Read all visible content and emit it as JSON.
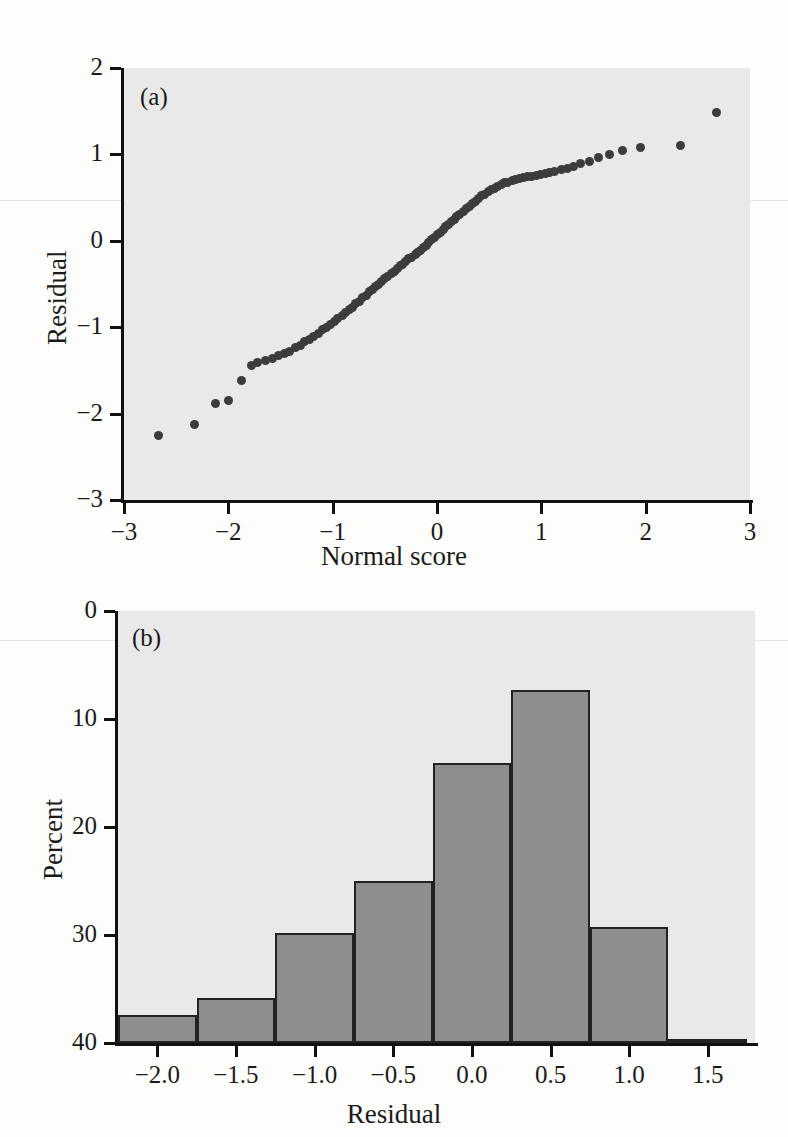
{
  "figure": {
    "background_color": "#fdfdfc",
    "plot_background_color": "#e9e9e9",
    "axis_color": "#111111",
    "point_color": "#3c3c3c",
    "bar_fill_color": "#8e8e8e",
    "bar_edge_color": "#222222"
  },
  "panel_a": {
    "tag": "(a)",
    "xlabel": "Normal score",
    "ylabel": "Residual",
    "xticks": [
      "−3",
      "−2",
      "−1",
      "0",
      "1",
      "2",
      "3"
    ],
    "yticks": [
      "2",
      "1",
      "0",
      "−1",
      "−2",
      "−3"
    ]
  },
  "panel_b": {
    "tag": "(b)",
    "xlabel": "Residual",
    "ylabel": "Percent",
    "xticks": [
      "−2.0",
      "−1.5",
      "−1.0",
      "−0.5",
      "0.0",
      "0.5",
      "1.0",
      "1.5"
    ],
    "yticks": [
      "40",
      "30",
      "20",
      "10",
      "0"
    ]
  },
  "chart_data": [
    {
      "type": "scatter",
      "title": "(a)",
      "xlabel": "Normal score",
      "ylabel": "Residual",
      "xlim": [
        -3,
        3
      ],
      "ylim": [
        -3,
        2
      ],
      "xticks": [
        -3,
        -2,
        -1,
        0,
        1,
        2,
        3
      ],
      "yticks": [
        2,
        1,
        0,
        -1,
        -2,
        -3
      ],
      "grid": false,
      "legend": "none",
      "series": [
        {
          "name": "Normal probability plot of residuals",
          "points": [
            [
              -2.67,
              -2.25
            ],
            [
              -2.32,
              -2.13
            ],
            [
              -2.12,
              -1.88
            ],
            [
              -2.0,
              -1.85
            ],
            [
              -1.87,
              -1.62
            ],
            [
              -1.78,
              -1.44
            ],
            [
              -1.72,
              -1.41
            ],
            [
              -1.64,
              -1.38
            ],
            [
              -1.58,
              -1.36
            ],
            [
              -1.52,
              -1.33
            ],
            [
              -1.46,
              -1.3
            ],
            [
              -1.41,
              -1.28
            ],
            [
              -1.36,
              -1.24
            ],
            [
              -1.31,
              -1.21
            ],
            [
              -1.27,
              -1.17
            ],
            [
              -1.22,
              -1.14
            ],
            [
              -1.18,
              -1.11
            ],
            [
              -1.14,
              -1.07
            ],
            [
              -1.1,
              -1.03
            ],
            [
              -1.06,
              -1.0
            ],
            [
              -1.02,
              -0.97
            ],
            [
              -0.98,
              -0.93
            ],
            [
              -0.95,
              -0.9
            ],
            [
              -0.91,
              -0.87
            ],
            [
              -0.88,
              -0.83
            ],
            [
              -0.84,
              -0.8
            ],
            [
              -0.81,
              -0.77
            ],
            [
              -0.78,
              -0.73
            ],
            [
              -0.74,
              -0.7
            ],
            [
              -0.71,
              -0.66
            ],
            [
              -0.68,
              -0.63
            ],
            [
              -0.65,
              -0.59
            ],
            [
              -0.62,
              -0.56
            ],
            [
              -0.59,
              -0.53
            ],
            [
              -0.56,
              -0.5
            ],
            [
              -0.53,
              -0.47
            ],
            [
              -0.5,
              -0.44
            ],
            [
              -0.47,
              -0.41
            ],
            [
              -0.44,
              -0.38
            ],
            [
              -0.41,
              -0.35
            ],
            [
              -0.38,
              -0.32
            ],
            [
              -0.35,
              -0.29
            ],
            [
              -0.33,
              -0.27
            ],
            [
              -0.3,
              -0.24
            ],
            [
              -0.27,
              -0.21
            ],
            [
              -0.24,
              -0.19
            ],
            [
              -0.21,
              -0.16
            ],
            [
              -0.19,
              -0.13
            ],
            [
              -0.16,
              -0.11
            ],
            [
              -0.13,
              -0.08
            ],
            [
              -0.1,
              -0.05
            ],
            [
              -0.08,
              -0.02
            ],
            [
              -0.05,
              0.01
            ],
            [
              -0.02,
              0.04
            ],
            [
              0.0,
              0.07
            ],
            [
              0.03,
              0.1
            ],
            [
              0.06,
              0.13
            ],
            [
              0.08,
              0.16
            ],
            [
              0.11,
              0.19
            ],
            [
              0.14,
              0.22
            ],
            [
              0.17,
              0.25
            ],
            [
              0.19,
              0.28
            ],
            [
              0.22,
              0.31
            ],
            [
              0.25,
              0.34
            ],
            [
              0.28,
              0.37
            ],
            [
              0.31,
              0.4
            ],
            [
              0.34,
              0.43
            ],
            [
              0.37,
              0.46
            ],
            [
              0.4,
              0.49
            ],
            [
              0.43,
              0.52
            ],
            [
              0.46,
              0.54
            ],
            [
              0.49,
              0.57
            ],
            [
              0.52,
              0.59
            ],
            [
              0.55,
              0.61
            ],
            [
              0.58,
              0.63
            ],
            [
              0.62,
              0.65
            ],
            [
              0.65,
              0.67
            ],
            [
              0.68,
              0.68
            ],
            [
              0.72,
              0.7
            ],
            [
              0.75,
              0.71
            ],
            [
              0.79,
              0.72
            ],
            [
              0.83,
              0.73
            ],
            [
              0.87,
              0.74
            ],
            [
              0.91,
              0.75
            ],
            [
              0.95,
              0.76
            ],
            [
              0.99,
              0.77
            ],
            [
              1.04,
              0.78
            ],
            [
              1.08,
              0.79
            ],
            [
              1.13,
              0.8
            ],
            [
              1.19,
              0.82
            ],
            [
              1.25,
              0.84
            ],
            [
              1.31,
              0.86
            ],
            [
              1.38,
              0.89
            ],
            [
              1.46,
              0.92
            ],
            [
              1.55,
              0.96
            ],
            [
              1.65,
              1.0
            ],
            [
              1.78,
              1.05
            ],
            [
              1.95,
              1.08
            ],
            [
              2.33,
              1.1
            ],
            [
              2.68,
              1.49
            ]
          ]
        }
      ]
    },
    {
      "type": "bar",
      "title": "(b)",
      "xlabel": "Residual",
      "ylabel": "Percent",
      "xlim": [
        -2.25,
        1.8
      ],
      "ylim": [
        0,
        40
      ],
      "xticks": [
        -2.0,
        -1.5,
        -1.0,
        -0.5,
        0.0,
        0.5,
        1.0,
        1.5
      ],
      "yticks": [
        0,
        10,
        20,
        30,
        40
      ],
      "grid": false,
      "legend": "none",
      "bin_edges": [
        -2.25,
        -1.75,
        -1.25,
        -0.75,
        -0.25,
        0.25,
        0.75,
        1.25,
        1.75
      ],
      "categories": [
        "−2.25 to −1.75",
        "−1.75 to −1.25",
        "−1.25 to −0.75",
        "−0.75 to −0.25",
        "−0.25 to 0.25",
        "0.25 to 0.75",
        "0.75 to 1.25",
        "1.25 to 1.75"
      ],
      "values": [
        2.6,
        4.2,
        10.2,
        15.0,
        25.9,
        32.7,
        10.7,
        0.4
      ]
    }
  ]
}
